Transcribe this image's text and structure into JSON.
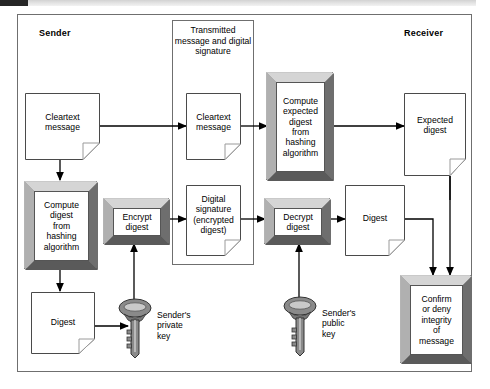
{
  "figure": {
    "type": "flow-diagram"
  },
  "topbar": {
    "dark_marker": "",
    "gray_strip": ""
  },
  "sections": {
    "sender_label": "Sender",
    "receiver_label": "Receiver",
    "transmitted_caption": "Transmitted\nmessage\nand digital\nsignature"
  },
  "nodes": {
    "cleartext_sender": {
      "label": "Cleartext\nmessage",
      "shape": "document"
    },
    "compute_digest_sender": {
      "label": "Compute\ndigest\nfrom\nhashing\nalgorithm",
      "shape": "process-3d"
    },
    "digest_sender": {
      "label": "Digest",
      "shape": "document"
    },
    "encrypt_digest": {
      "label": "Encrypt\ndigest",
      "shape": "process-3d"
    },
    "cleartext_transmitted": {
      "label": "Cleartext\nmessage",
      "shape": "document"
    },
    "digital_signature": {
      "label": "Digital\nsignature\n(encrypted\ndigest)",
      "shape": "document"
    },
    "compute_expected_digest": {
      "label": "Compute\nexpected\ndigest\nfrom\nhashing\nalgorithm",
      "shape": "process-3d"
    },
    "expected_digest": {
      "label": "Expected\ndigest",
      "shape": "document"
    },
    "decrypt_digest": {
      "label": "Decrypt\ndigest",
      "shape": "process-3d"
    },
    "digest_receiver": {
      "label": "Digest",
      "shape": "document"
    },
    "confirm_deny": {
      "label": "Confirm\nor deny\nintegrity\nof\nmessage",
      "shape": "process-3d"
    }
  },
  "keys": {
    "private_key": {
      "label": "Sender's\nprivate\nkey",
      "icon": "key-icon"
    },
    "public_key": {
      "label": "Sender's\npublic\nkey",
      "icon": "key-icon"
    }
  },
  "colors": {
    "line": "#000000",
    "frame": "#6f6f6f",
    "bevel_fill": "#8d8d8d",
    "bevel_light": "#c9c9c9",
    "bevel_dark": "#4e4e4e",
    "paper": "#ffffff",
    "key_body": "#7a7a7a"
  }
}
